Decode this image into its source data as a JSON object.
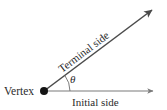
{
  "figure": {
    "type": "geometry-angle-diagram",
    "background_color": "#ffffff",
    "stroke_color": "#4a4a4a",
    "text_color": "#2b2b2b"
  },
  "labels": {
    "vertex": "Vertex",
    "initial_side": "Initial side",
    "terminal_side": "Terminal side",
    "angle_symbol": "θ"
  },
  "geometry": {
    "vertex_point": {
      "x": 44,
      "y": 91
    },
    "vertex_dot_radius": 4,
    "initial_ray_end": {
      "x": 158,
      "y": 91
    },
    "terminal_ray_end": {
      "x": 157,
      "y": 6
    },
    "terminal_ray_angle_degrees": 37,
    "arc_radius": 26,
    "arc_start": {
      "x": 70,
      "y": 91
    },
    "arc_end": {
      "x": 65,
      "y": 76
    }
  },
  "label_positions": {
    "vertex": {
      "x": 5,
      "y": 95
    },
    "initial_side": {
      "x": 72,
      "y": 106
    },
    "terminal_side": {
      "x": 62,
      "y": 72,
      "rotation": -37
    },
    "theta": {
      "x": 71,
      "y": 82
    }
  }
}
